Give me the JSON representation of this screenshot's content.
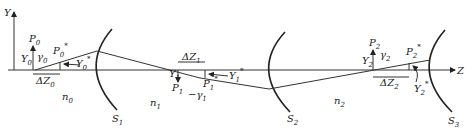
{
  "diagram": {
    "axes": {
      "vertical": "Y",
      "horizontal": "Z"
    },
    "surfaces": [
      {
        "label": "S",
        "sub": "1"
      },
      {
        "label": "S",
        "sub": "2"
      },
      {
        "label": "S",
        "sub": "3"
      }
    ],
    "media": [
      {
        "label": "n",
        "sub": "0"
      },
      {
        "label": "n",
        "sub": "1"
      },
      {
        "label": "n",
        "sub": "2"
      }
    ],
    "points": {
      "P0": {
        "label": "P",
        "sub": "0"
      },
      "P0s": {
        "label": "P",
        "sub": "0",
        "sup": "*"
      },
      "P1": {
        "label": "P",
        "sub": "1"
      },
      "P1s": {
        "label": "P",
        "sub": "1",
        "sup": "*"
      },
      "P2": {
        "label": "P",
        "sub": "2"
      },
      "P2s": {
        "label": "P",
        "sub": "2",
        "sup": "*"
      }
    },
    "heights": {
      "Y0": {
        "label": "Y",
        "sub": "0"
      },
      "Y0s": {
        "label": "Y",
        "sub": "0",
        "sup": "*"
      },
      "Y1": {
        "label": "Y",
        "sub": "1"
      },
      "Y1s": {
        "label": "Y",
        "sub": "1",
        "sup": "*"
      },
      "Y2": {
        "label": "Y",
        "sub": "2"
      },
      "Y2s": {
        "label": "Y",
        "sub": "2",
        "sup": "*"
      }
    },
    "angles": {
      "g0": {
        "label": "γ",
        "sub": "0"
      },
      "g1": {
        "label": "−γ",
        "sub": "1"
      },
      "g2": {
        "label": "γ",
        "sub": "2"
      }
    },
    "shifts": {
      "dZ0": {
        "label": "ΔZ",
        "sub": "0"
      },
      "dZ1": {
        "label": "ΔZ",
        "sub": "1"
      },
      "dZ2": {
        "label": "ΔZ",
        "sub": "2"
      }
    }
  }
}
